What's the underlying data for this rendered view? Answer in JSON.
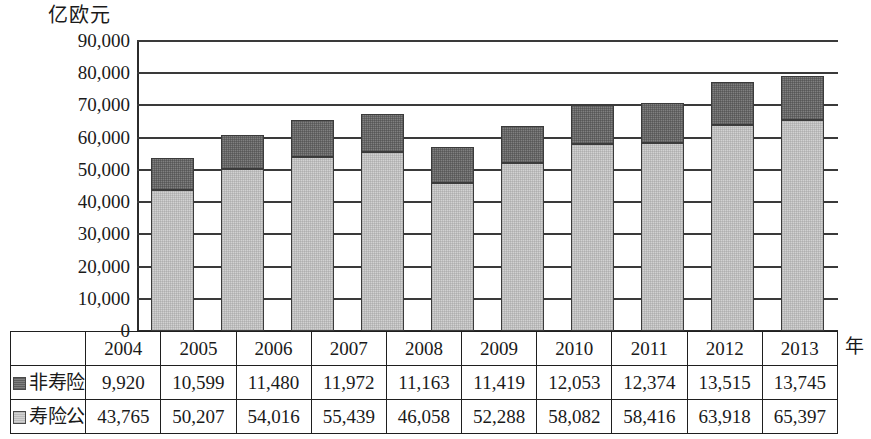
{
  "axis": {
    "y_unit_label": "亿欧元",
    "x_unit_label": "年",
    "y_ticks": [
      "90,000",
      "80,000",
      "70,000",
      "60,000",
      "50,000",
      "40,000",
      "30,000",
      "20,000",
      "10,000",
      "0"
    ]
  },
  "legend": {
    "series_top": "非寿险公司",
    "series_bottom": "寿险公司",
    "swatch_top_color": "#808080",
    "swatch_bottom_color": "#d2d2d2"
  },
  "table": {
    "years": [
      "2004",
      "2005",
      "2006",
      "2007",
      "2008",
      "2009",
      "2010",
      "2011",
      "2012",
      "2013"
    ],
    "row_nonlife_label": "非寿险公司",
    "row_life_label": "寿险公司",
    "row_nonlife_values": [
      "9,920",
      "10,599",
      "11,480",
      "11,972",
      "11,163",
      "11,419",
      "12,053",
      "12,374",
      "13,515",
      "13,745"
    ],
    "row_life_values": [
      "43,765",
      "50,207",
      "54,016",
      "55,439",
      "46,058",
      "52,288",
      "58,082",
      "58,416",
      "63,918",
      "65,397"
    ]
  },
  "chart_data": {
    "type": "bar",
    "stacked": true,
    "title": "",
    "xlabel": "年",
    "ylabel": "亿欧元",
    "ylim": [
      0,
      90000
    ],
    "ytick_interval": 10000,
    "grid": true,
    "legend_position": "table-row-headers",
    "categories": [
      "2004",
      "2005",
      "2006",
      "2007",
      "2008",
      "2009",
      "2010",
      "2011",
      "2012",
      "2013"
    ],
    "series": [
      {
        "name": "寿险公司",
        "color": "#d2d2d2",
        "stack_order": "bottom",
        "values": [
          43765,
          50207,
          54016,
          55439,
          46058,
          52288,
          58082,
          58416,
          63918,
          65397
        ]
      },
      {
        "name": "非寿险公司",
        "color": "#808080",
        "stack_order": "top",
        "values": [
          9920,
          10599,
          11480,
          11972,
          11163,
          11419,
          12053,
          12374,
          13515,
          13745
        ]
      }
    ],
    "totals": [
      53685,
      60806,
      65496,
      67411,
      57221,
      63707,
      70135,
      70790,
      77433,
      79142
    ]
  }
}
